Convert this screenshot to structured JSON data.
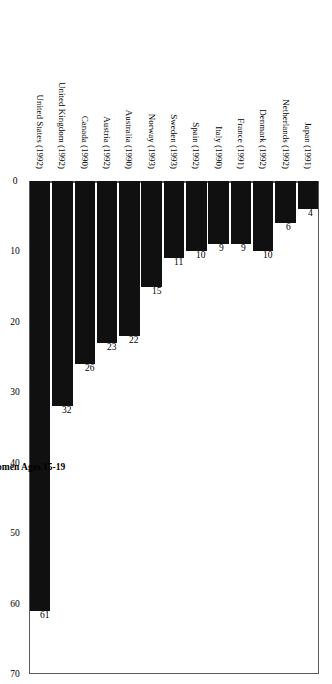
{
  "chart_data": {
    "type": "bar",
    "orientation": "vertical-rotated",
    "title": "",
    "xlabel": "",
    "ylabel": "Births per 1,000 Women Ages 15-19",
    "ylim": [
      0,
      70
    ],
    "ytick_step": 10,
    "yticks": [
      "0",
      "10",
      "20",
      "30",
      "40",
      "50",
      "60",
      "70"
    ],
    "grid": false,
    "legend": null,
    "bar_color": "#101010",
    "frame_color": "#5a5a5a",
    "categories": [
      "Japan (1991)",
      "Netherlands (1992)",
      "Denmark (1992)",
      "France (1991)",
      "Italy (1990)",
      "Spain (1992)",
      "Sweden (1993)",
      "Norway (1993)",
      "Australia (1990)",
      "Austria (1992)",
      "Canada (1990)",
      "United Kingdom (1992)",
      "United States (1992)"
    ],
    "values": [
      4,
      6,
      10,
      9,
      9,
      10,
      11,
      15,
      22,
      23,
      26,
      32,
      61
    ],
    "value_labels": [
      "4",
      "6",
      "10",
      "9",
      "9",
      "10",
      "11",
      "15",
      "22",
      "23",
      "26",
      "32",
      "61"
    ]
  }
}
